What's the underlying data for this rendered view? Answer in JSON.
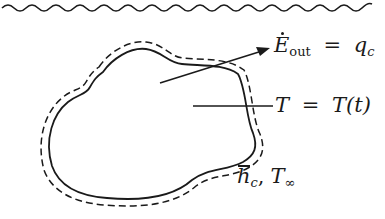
{
  "figure": {
    "type": "heat-transfer-diagram",
    "top_boundary": "wavy-line",
    "body_outline": "solid",
    "boundary_layer": "dashed"
  },
  "labels": {
    "energy_out": {
      "symbol": "E",
      "subscript": "out",
      "equals": "=",
      "rhs_symbol": "q",
      "rhs_subscript": "c"
    },
    "temperature": {
      "lhs": "T",
      "equals": "=",
      "rhs": "T(t)"
    },
    "convection": {
      "h_symbol": "h",
      "h_subscript": "c",
      "separator": ",",
      "t_symbol": "T",
      "t_subscript": "∞"
    }
  },
  "colors": {
    "ink": "#1a1a1a",
    "background": "#ffffff"
  }
}
